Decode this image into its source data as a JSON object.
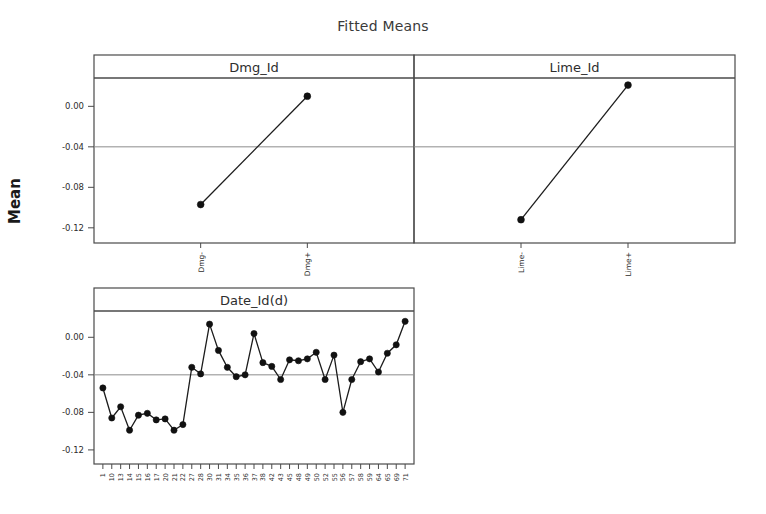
{
  "chart_data": {
    "type": "line",
    "title": "Fitted Means",
    "ylabel": "Mean",
    "xlabel": "",
    "ylim": [
      -0.135,
      0.028
    ],
    "yticks": [
      0.0,
      -0.04,
      -0.08,
      -0.12
    ],
    "ytick_labels": [
      "0.00",
      "-0.04",
      "-0.08",
      "-0.12"
    ],
    "grid": true,
    "gridlines_at": [
      -0.04
    ],
    "legend": null,
    "panels": [
      {
        "id": "dmg",
        "title": "Dmg_Id",
        "categories": [
          "Dmg-",
          "Dmg+"
        ],
        "values": [
          -0.097,
          0.01
        ]
      },
      {
        "id": "lime",
        "title": "Lime_Id",
        "categories": [
          "Lime-",
          "Lime+"
        ],
        "values": [
          -0.112,
          0.021
        ]
      },
      {
        "id": "date",
        "title": "Date_Id(d)",
        "categories": [
          "1",
          "10",
          "13",
          "14",
          "15",
          "16",
          "17",
          "20",
          "21",
          "22",
          "27",
          "28",
          "30",
          "31",
          "34",
          "35",
          "36",
          "37",
          "38",
          "42",
          "43",
          "45",
          "48",
          "49",
          "50",
          "52",
          "55",
          "56",
          "57",
          "58",
          "59",
          "64",
          "65",
          "69",
          "71"
        ],
        "values": [
          -0.054,
          -0.086,
          -0.074,
          -0.099,
          -0.083,
          -0.081,
          -0.088,
          -0.087,
          -0.099,
          -0.093,
          -0.032,
          -0.039,
          0.014,
          -0.014,
          -0.032,
          -0.042,
          -0.04,
          0.004,
          -0.027,
          -0.031,
          -0.045,
          -0.024,
          -0.025,
          -0.023,
          -0.016,
          -0.045,
          -0.019,
          -0.08,
          -0.045,
          -0.026,
          -0.023,
          -0.037,
          -0.017,
          -0.008,
          0.017
        ]
      }
    ]
  },
  "colors": {
    "frame": "#4a4a4a",
    "grid": "#8d8d8d",
    "series": "#111111",
    "text": "#2d2d2d",
    "background": "#ffffff"
  }
}
